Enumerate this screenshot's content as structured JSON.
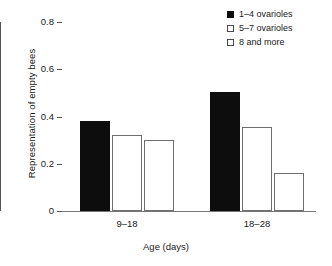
{
  "chart_data": {
    "type": "bar",
    "title": "",
    "xlabel": "Age (days)",
    "ylabel": "Representation of empty bees",
    "categories": [
      "9–18",
      "18–28"
    ],
    "ylim": [
      0,
      0.8
    ],
    "yticks": [
      "0",
      "0.2",
      "0.4",
      "0.6",
      "0.8"
    ],
    "ytick_values": [
      0,
      0.2,
      0.4,
      0.6,
      0.8
    ],
    "grid": false,
    "legend_position": "top-right",
    "series": [
      {
        "name": "1–4 ovarioles",
        "values": [
          0.38,
          0.505
        ],
        "fill": "#0d0d0d",
        "marker": "filled-square"
      },
      {
        "name": "5–7 ovarioles",
        "values": [
          0.32,
          0.355
        ],
        "fill": "#ffffff",
        "marker": "open-square"
      },
      {
        "name": "8 and more",
        "values": [
          0.3,
          0.16
        ],
        "fill": "#ffffff",
        "marker": "open-square"
      }
    ]
  }
}
